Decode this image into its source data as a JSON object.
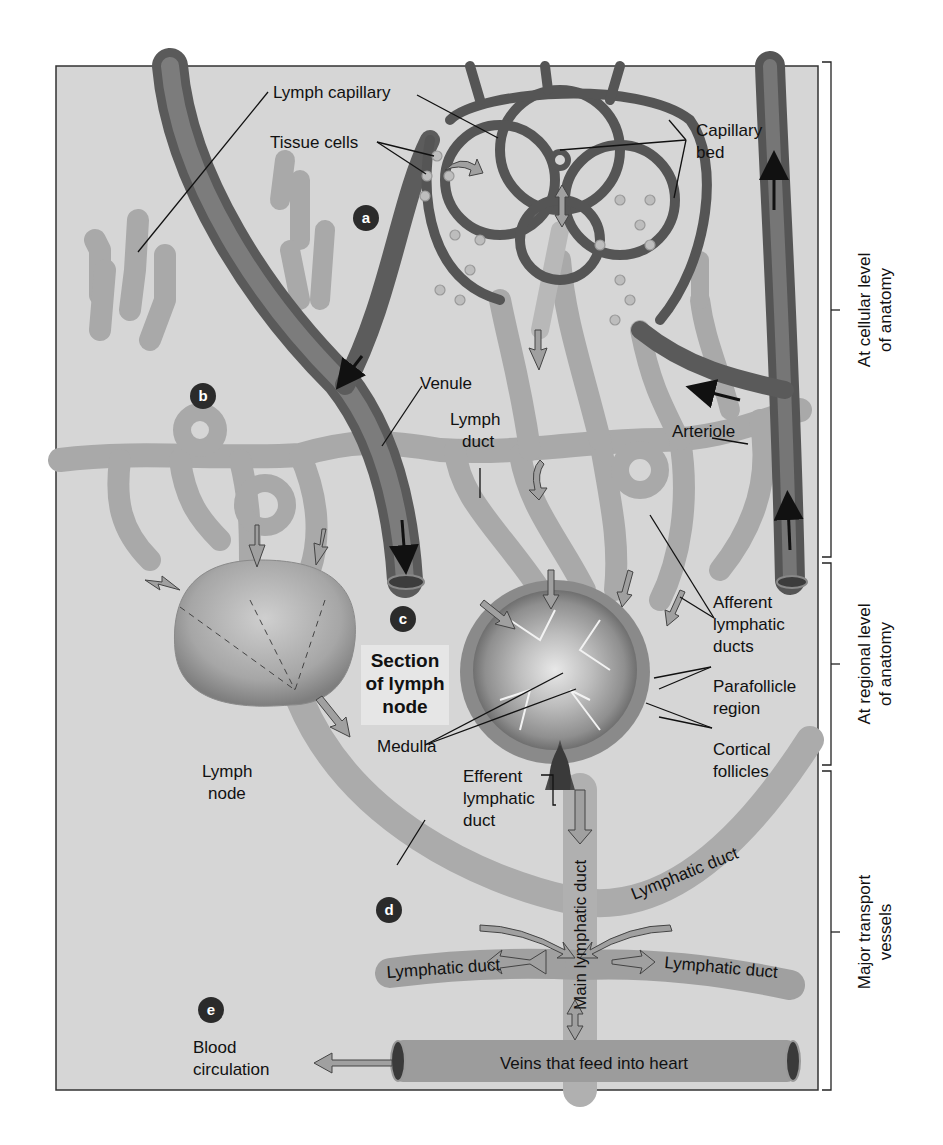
{
  "figure": {
    "type": "anatomical-diagram",
    "colors": {
      "background_panel": "#d6d6d6",
      "blood_vessel": "#6e6e6e",
      "blood_vessel_dark": "#4a4a4a",
      "lymph_vessel": "#a8a8a8",
      "lymph_vessel_light": "#c4c4c4",
      "marker_circle": "#2b2b2b",
      "arrow_fill": "#9a9a9a",
      "text": "#111111",
      "section_label_bg": "#e6e6e6"
    }
  },
  "markers": [
    {
      "id": "a",
      "label": "a"
    },
    {
      "id": "b",
      "label": "b"
    },
    {
      "id": "c",
      "label": "c"
    },
    {
      "id": "d",
      "label": "d"
    },
    {
      "id": "e",
      "label": "e"
    }
  ],
  "labels": {
    "lymph_capillary": "Lymph capillary",
    "tissue_cells": "Tissue cells",
    "capillary_bed_1": "Capillary",
    "capillary_bed_2": "bed",
    "venule": "Venule",
    "lymph_duct_1": "Lymph",
    "lymph_duct_2": "duct",
    "arteriole": "Arteriole",
    "afferent_1": "Afferent",
    "afferent_2": "lymphatic",
    "afferent_3": "ducts",
    "section_1": "Section",
    "section_2": "of lymph",
    "section_3": "node",
    "parafollicle_1": "Parafollicle",
    "parafollicle_2": "region",
    "medulla": "Medulla",
    "cortical_1": "Cortical",
    "cortical_2": "follicles",
    "lymph_node_1": "Lymph",
    "lymph_node_2": "node",
    "efferent_1": "Efferent",
    "efferent_2": "lymphatic",
    "efferent_3": "duct",
    "main_lymphatic_duct": "Main lymphatic duct",
    "lymphatic_duct_upper_right": "Lymphatic duct",
    "lymphatic_duct_left": "Lymphatic duct",
    "lymphatic_duct_right": "Lymphatic duct",
    "blood_circulation_1": "Blood",
    "blood_circulation_2": "circulation",
    "veins_heart": "Veins that feed into heart"
  },
  "levels": [
    {
      "name": "cellular",
      "line1": "At cellular level",
      "line2": "of anatomy"
    },
    {
      "name": "regional",
      "line1": "At regional level",
      "line2": "of anatomy"
    },
    {
      "name": "transport",
      "line1": "Major transport",
      "line2": "vessels"
    }
  ]
}
